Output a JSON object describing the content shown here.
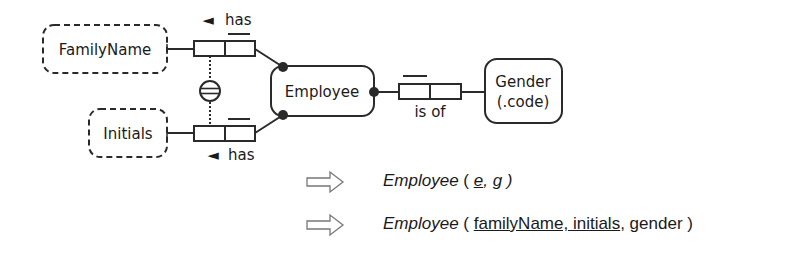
{
  "diagram": {
    "entities": {
      "family_name": {
        "label": "FamilyName",
        "kind": "value-type"
      },
      "initials": {
        "label": "Initials",
        "kind": "value-type"
      },
      "employee": {
        "label": "Employee",
        "kind": "entity-type"
      },
      "gender": {
        "line1": "Gender",
        "line2": "(.code)",
        "kind": "entity-type"
      }
    },
    "fact_types": {
      "employee_has_family_name": {
        "reading": "has",
        "direction_marker": "◄"
      },
      "employee_has_initials": {
        "reading": "has",
        "direction_marker": "◄"
      },
      "employee_is_of_gender": {
        "reading": "is of"
      }
    },
    "constraints": {
      "external_uniqueness": "double-line circle (external uniqueness / preferred identifier)"
    },
    "colors": {
      "stroke": "#2a2a2a",
      "text": "#1a1a1a",
      "arrow": "#777777"
    }
  },
  "mappings": [
    {
      "arrow": "⇨",
      "relation_name": "Employee",
      "open": " ( ",
      "key": "e",
      "rest": ", g )"
    },
    {
      "arrow": "⇨",
      "relation_name": "Employee",
      "open": " ( ",
      "key": "familyName, initials",
      "rest": ", gender )"
    }
  ]
}
